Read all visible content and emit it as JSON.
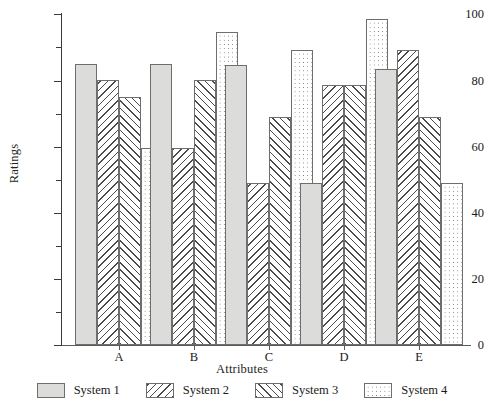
{
  "chart_data": {
    "type": "bar",
    "title": "",
    "xlabel": "Attributes",
    "ylabel": "Ratings",
    "categories": [
      "A",
      "B",
      "C",
      "D",
      "E"
    ],
    "series": [
      {
        "name": "System 1",
        "pattern": "solid-grey",
        "values": [
          85,
          85,
          84.5,
          49,
          83.5
        ]
      },
      {
        "name": "System 2",
        "pattern": "backslash-hatch",
        "values": [
          80,
          59.5,
          49,
          78.5,
          89
        ]
      },
      {
        "name": "System 3",
        "pattern": "slash-hatch",
        "values": [
          75,
          80,
          69,
          78.5,
          69
        ]
      },
      {
        "name": "System 4",
        "pattern": "dotted",
        "values": [
          59.5,
          94.5,
          89,
          98.5,
          49
        ]
      }
    ],
    "ylim": [
      0,
      100
    ],
    "ytick_labels": [
      "0",
      "20",
      "40",
      "60",
      "80",
      "100"
    ],
    "ytick_values": [
      0,
      20,
      40,
      60,
      80,
      100
    ],
    "yminor_values": [
      10,
      30,
      50,
      70,
      90
    ],
    "grid": false,
    "legend_position": "bottom",
    "colors": {
      "series1_fill": "#dcdcda",
      "hatch": "#4a4a4a",
      "outline": "#6e6e6e",
      "axis": "#3a3a3a",
      "text": "#1a1a1a",
      "background": "#ffffff"
    }
  },
  "axis": {
    "y_title": "Ratings",
    "x_title": "Attributes",
    "y_ticks": [
      {
        "label": "100",
        "value": 100
      },
      {
        "label": "80",
        "value": 80
      },
      {
        "label": "60",
        "value": 60
      },
      {
        "label": "40",
        "value": 40
      },
      {
        "label": "20",
        "value": 20
      },
      {
        "label": "0",
        "value": 0
      }
    ]
  },
  "legend": {
    "items": [
      {
        "label": "System 1"
      },
      {
        "label": "System 2"
      },
      {
        "label": "System 3"
      },
      {
        "label": "System 4"
      }
    ]
  },
  "categories": [
    {
      "label": "A"
    },
    {
      "label": "B"
    },
    {
      "label": "C"
    },
    {
      "label": "D"
    },
    {
      "label": "E"
    }
  ]
}
